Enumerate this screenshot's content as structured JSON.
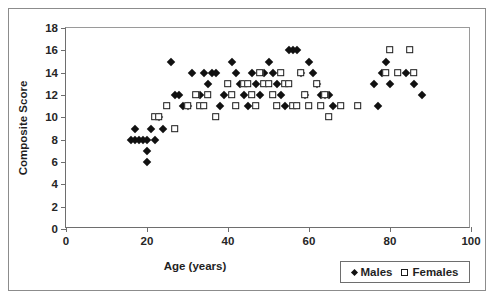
{
  "chart_data": {
    "type": "scatter",
    "title": "",
    "xlabel": "Age (years)",
    "ylabel": "Composite Score",
    "xlim": [
      0,
      100
    ],
    "ylim": [
      0,
      18
    ],
    "xticks": [
      0,
      20,
      40,
      60,
      80,
      100
    ],
    "yticks": [
      0,
      2,
      4,
      6,
      8,
      10,
      12,
      14,
      16,
      18
    ],
    "xtick_labels": [
      "0",
      "20",
      "40",
      "60",
      "80",
      "100"
    ],
    "ytick_labels": [
      "0",
      "2",
      "4",
      "6",
      "8",
      "10",
      "12",
      "14",
      "16",
      "18"
    ],
    "grid": false,
    "legend_position": "bottom-right",
    "series": [
      {
        "name": "Males",
        "marker": "filled-diamond",
        "color": "#111111",
        "points": [
          [
            16,
            8
          ],
          [
            17,
            8
          ],
          [
            17,
            9
          ],
          [
            18,
            8
          ],
          [
            19,
            8
          ],
          [
            20,
            8
          ],
          [
            20,
            7
          ],
          [
            20,
            6
          ],
          [
            21,
            9
          ],
          [
            22,
            8
          ],
          [
            23,
            10
          ],
          [
            24,
            9
          ],
          [
            26,
            15
          ],
          [
            27,
            12
          ],
          [
            28,
            12
          ],
          [
            29,
            11
          ],
          [
            30,
            11
          ],
          [
            31,
            14
          ],
          [
            33,
            12
          ],
          [
            34,
            14
          ],
          [
            35,
            13
          ],
          [
            36,
            14
          ],
          [
            37,
            14
          ],
          [
            38,
            11
          ],
          [
            39,
            12
          ],
          [
            41,
            15
          ],
          [
            42,
            14
          ],
          [
            43,
            13
          ],
          [
            44,
            12
          ],
          [
            45,
            11
          ],
          [
            46,
            14
          ],
          [
            47,
            13
          ],
          [
            48,
            12
          ],
          [
            49,
            14
          ],
          [
            50,
            15
          ],
          [
            51,
            14
          ],
          [
            52,
            13
          ],
          [
            53,
            12
          ],
          [
            54,
            11
          ],
          [
            55,
            16
          ],
          [
            56,
            16
          ],
          [
            57,
            16
          ],
          [
            58,
            14
          ],
          [
            59,
            12
          ],
          [
            60,
            15
          ],
          [
            61,
            14
          ],
          [
            62,
            13
          ],
          [
            63,
            12
          ],
          [
            64,
            12
          ],
          [
            65,
            12
          ],
          [
            66,
            11
          ],
          [
            76,
            13
          ],
          [
            77,
            11
          ],
          [
            78,
            14
          ],
          [
            79,
            15
          ],
          [
            80,
            13
          ],
          [
            84,
            14
          ],
          [
            86,
            13
          ],
          [
            88,
            12
          ]
        ]
      },
      {
        "name": "Females",
        "marker": "open-square",
        "color": "#ffffff",
        "points": [
          [
            22,
            10
          ],
          [
            23,
            10
          ],
          [
            25,
            11
          ],
          [
            27,
            9
          ],
          [
            30,
            11
          ],
          [
            32,
            12
          ],
          [
            33,
            11
          ],
          [
            34,
            11
          ],
          [
            35,
            12
          ],
          [
            37,
            10
          ],
          [
            40,
            13
          ],
          [
            41,
            12
          ],
          [
            42,
            11
          ],
          [
            44,
            13
          ],
          [
            45,
            13
          ],
          [
            46,
            12
          ],
          [
            47,
            11
          ],
          [
            48,
            14
          ],
          [
            49,
            13
          ],
          [
            50,
            13
          ],
          [
            51,
            12
          ],
          [
            52,
            11
          ],
          [
            53,
            14
          ],
          [
            54,
            13
          ],
          [
            55,
            13
          ],
          [
            56,
            11
          ],
          [
            57,
            11
          ],
          [
            58,
            14
          ],
          [
            59,
            12
          ],
          [
            60,
            11
          ],
          [
            62,
            13
          ],
          [
            63,
            11
          ],
          [
            64,
            12
          ],
          [
            65,
            10
          ],
          [
            68,
            11
          ],
          [
            72,
            11
          ],
          [
            79,
            14
          ],
          [
            80,
            16
          ],
          [
            82,
            14
          ],
          [
            85,
            16
          ],
          [
            86,
            14
          ]
        ]
      }
    ]
  },
  "legend": {
    "entries": [
      {
        "label": "Males",
        "marker": "filled-diamond"
      },
      {
        "label": "Females",
        "marker": "open-square"
      }
    ]
  }
}
